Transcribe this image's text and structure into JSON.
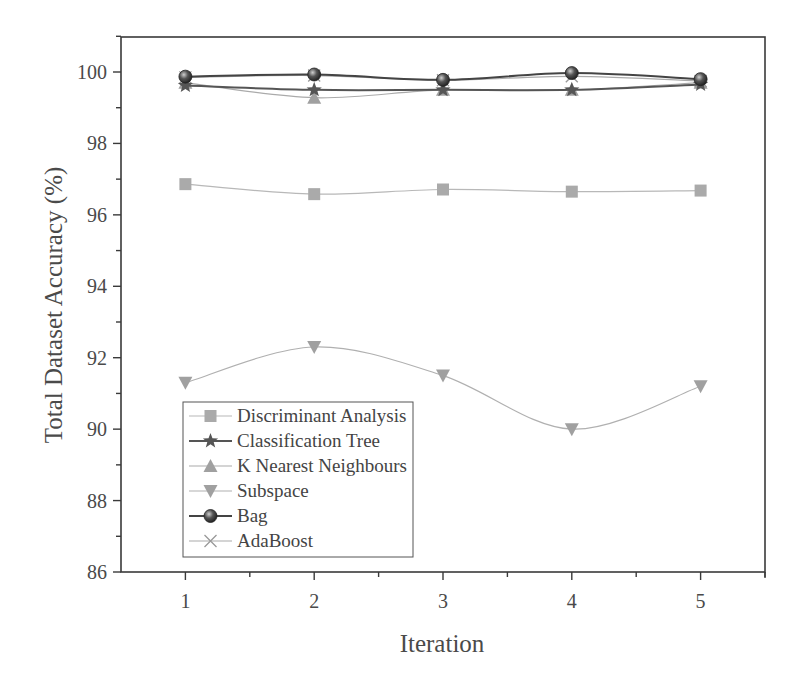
{
  "chart_data": {
    "type": "line",
    "title": "",
    "xlabel": "Iteration",
    "ylabel": "Total Dataset Accuracy (%)",
    "x": [
      1,
      2,
      3,
      4,
      5
    ],
    "xlim": [
      0.5,
      5.5
    ],
    "ylim": [
      86,
      101
    ],
    "xticks": [
      1,
      2,
      3,
      4,
      5
    ],
    "yticks": [
      86,
      88,
      90,
      92,
      94,
      96,
      98,
      100
    ],
    "grid": false,
    "legend_position": "lower left",
    "series": [
      {
        "name": "Discriminant Analysis",
        "marker": "square",
        "color": "#aaaaaa",
        "line_color": "#b8b8b8",
        "values": [
          96.86,
          96.58,
          96.71,
          96.65,
          96.68
        ]
      },
      {
        "name": "Classification Tree",
        "marker": "star",
        "color": "#555555",
        "line_color": "#555555",
        "values": [
          99.62,
          99.5,
          99.5,
          99.5,
          99.65
        ]
      },
      {
        "name": "K Nearest Neighbours",
        "marker": "triangle-up",
        "color": "#a0a0a0",
        "line_color": "#aaaaaa",
        "values": [
          99.7,
          99.28,
          99.5,
          99.5,
          99.7
        ]
      },
      {
        "name": "Subspace",
        "marker": "triangle-down",
        "color": "#a0a0a0",
        "line_color": "#b0b0b0",
        "values": [
          91.3,
          92.3,
          91.5,
          90.0,
          91.2
        ]
      },
      {
        "name": "Bag",
        "marker": "sphere",
        "color": "#333333",
        "line_color": "#444444",
        "values": [
          99.87,
          99.93,
          99.78,
          99.97,
          99.8
        ]
      },
      {
        "name": "AdaBoost",
        "marker": "x",
        "color": "#999999",
        "line_color": "#aaaaaa",
        "values": [
          99.85,
          99.9,
          99.77,
          99.88,
          99.75
        ]
      }
    ]
  },
  "axes": {
    "x_title": "Iteration",
    "y_title": "Total Dataset Accuracy (%)",
    "x_tick_labels": [
      "1",
      "2",
      "3",
      "4",
      "5"
    ],
    "y_tick_labels": [
      "86",
      "88",
      "90",
      "92",
      "94",
      "96",
      "98",
      "100"
    ]
  },
  "legend": {
    "items": [
      {
        "label": "Discriminant Analysis"
      },
      {
        "label": "Classification Tree"
      },
      {
        "label": "K Nearest Neighbours"
      },
      {
        "label": "Subspace"
      },
      {
        "label": "Bag"
      },
      {
        "label": "AdaBoost"
      }
    ]
  }
}
